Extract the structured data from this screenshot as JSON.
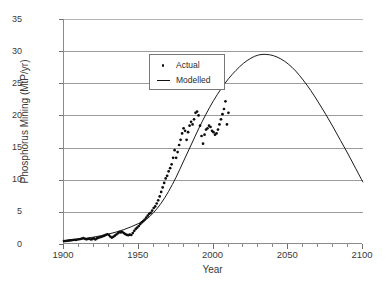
{
  "chart_data": {
    "type": "line",
    "title": "",
    "xlabel": "Year",
    "ylabel": "Phosphorus Mining (MtP/yr)",
    "xlim": [
      1900,
      2100
    ],
    "ylim": [
      0,
      35
    ],
    "xticks": [
      1900,
      1950,
      2000,
      2050,
      2100
    ],
    "xtick_labels": [
      "1900",
      "1950",
      "2000",
      "2050",
      "2100"
    ],
    "xtick_minor_step": 10,
    "yticks": [
      0,
      5,
      10,
      15,
      20,
      25,
      30,
      35
    ],
    "ytick_labels": [
      "0",
      "5",
      "10",
      "15",
      "20",
      "25",
      "30",
      "35"
    ],
    "grid": "horizontal",
    "legend_position": "upper-left-inside",
    "series": [
      {
        "name": "Actual",
        "label": "Actual",
        "marker": "dot",
        "color": "#0d0d0d",
        "points": [
          [
            1900,
            0.45
          ],
          [
            1901,
            0.47
          ],
          [
            1902,
            0.5
          ],
          [
            1903,
            0.53
          ],
          [
            1904,
            0.55
          ],
          [
            1905,
            0.58
          ],
          [
            1906,
            0.62
          ],
          [
            1907,
            0.66
          ],
          [
            1908,
            0.64
          ],
          [
            1909,
            0.7
          ],
          [
            1910,
            0.74
          ],
          [
            1911,
            0.78
          ],
          [
            1912,
            0.84
          ],
          [
            1913,
            0.9
          ],
          [
            1914,
            0.8
          ],
          [
            1915,
            0.72
          ],
          [
            1916,
            0.78
          ],
          [
            1917,
            0.82
          ],
          [
            1918,
            0.7
          ],
          [
            1919,
            0.76
          ],
          [
            1920,
            0.88
          ],
          [
            1921,
            0.7
          ],
          [
            1922,
            0.86
          ],
          [
            1923,
            0.98
          ],
          [
            1924,
            1.05
          ],
          [
            1925,
            1.12
          ],
          [
            1926,
            1.22
          ],
          [
            1927,
            1.3
          ],
          [
            1928,
            1.42
          ],
          [
            1929,
            1.52
          ],
          [
            1930,
            1.4
          ],
          [
            1931,
            1.15
          ],
          [
            1932,
            1.0
          ],
          [
            1933,
            1.12
          ],
          [
            1934,
            1.3
          ],
          [
            1935,
            1.48
          ],
          [
            1936,
            1.66
          ],
          [
            1937,
            1.86
          ],
          [
            1938,
            1.8
          ],
          [
            1939,
            1.88
          ],
          [
            1940,
            1.7
          ],
          [
            1941,
            1.55
          ],
          [
            1942,
            1.42
          ],
          [
            1943,
            1.38
          ],
          [
            1944,
            1.45
          ],
          [
            1945,
            1.4
          ],
          [
            1946,
            1.7
          ],
          [
            1947,
            2.05
          ],
          [
            1948,
            2.35
          ],
          [
            1949,
            2.55
          ],
          [
            1950,
            2.8
          ],
          [
            1951,
            3.1
          ],
          [
            1952,
            3.35
          ],
          [
            1953,
            3.55
          ],
          [
            1954,
            3.8
          ],
          [
            1955,
            4.1
          ],
          [
            1956,
            4.4
          ],
          [
            1957,
            4.7
          ],
          [
            1958,
            4.85
          ],
          [
            1959,
            5.2
          ],
          [
            1960,
            5.6
          ],
          [
            1961,
            5.85
          ],
          [
            1962,
            6.3
          ],
          [
            1963,
            6.8
          ],
          [
            1964,
            7.4
          ],
          [
            1965,
            8.1
          ],
          [
            1966,
            8.8
          ],
          [
            1967,
            9.5
          ],
          [
            1968,
            10.2
          ],
          [
            1969,
            10.6
          ],
          [
            1970,
            11.3
          ],
          [
            1971,
            11.8
          ],
          [
            1972,
            12.4
          ],
          [
            1973,
            13.4
          ],
          [
            1974,
            14.6
          ],
          [
            1975,
            13.4
          ],
          [
            1976,
            14.3
          ],
          [
            1977,
            15.4
          ],
          [
            1978,
            16.2
          ],
          [
            1979,
            17.2
          ],
          [
            1980,
            18.0
          ],
          [
            1981,
            17.6
          ],
          [
            1982,
            16.2
          ],
          [
            1983,
            17.4
          ],
          [
            1984,
            18.4
          ],
          [
            1985,
            19.0
          ],
          [
            1986,
            18.6
          ],
          [
            1987,
            19.4
          ],
          [
            1988,
            20.4
          ],
          [
            1989,
            20.6
          ],
          [
            1990,
            20.0
          ],
          [
            1991,
            18.4
          ],
          [
            1992,
            16.8
          ],
          [
            1993,
            15.6
          ],
          [
            1994,
            17.0
          ],
          [
            1995,
            17.8
          ],
          [
            1996,
            18.0
          ],
          [
            1997,
            18.4
          ],
          [
            1998,
            18.2
          ],
          [
            1999,
            17.6
          ],
          [
            2000,
            17.4
          ],
          [
            2001,
            17.0
          ],
          [
            2002,
            17.2
          ],
          [
            2003,
            17.8
          ],
          [
            2004,
            18.6
          ],
          [
            2005,
            19.4
          ],
          [
            2006,
            20.2
          ],
          [
            2007,
            21.0
          ],
          [
            2008,
            22.2
          ],
          [
            2009,
            18.6
          ],
          [
            2010,
            20.4
          ]
        ]
      },
      {
        "name": "Modelled",
        "label": "Modelled",
        "marker": "line",
        "color": "#1a1a1a",
        "points": [
          [
            1900,
            0.52
          ],
          [
            1905,
            0.62
          ],
          [
            1910,
            0.75
          ],
          [
            1915,
            0.9
          ],
          [
            1920,
            1.08
          ],
          [
            1925,
            1.3
          ],
          [
            1930,
            1.56
          ],
          [
            1935,
            1.87
          ],
          [
            1940,
            2.24
          ],
          [
            1945,
            2.68
          ],
          [
            1950,
            3.2
          ],
          [
            1955,
            3.82
          ],
          [
            1960,
            4.9
          ],
          [
            1965,
            6.35
          ],
          [
            1970,
            8.2
          ],
          [
            1975,
            10.4
          ],
          [
            1980,
            12.9
          ],
          [
            1985,
            15.4
          ],
          [
            1990,
            17.9
          ],
          [
            1995,
            20.2
          ],
          [
            2000,
            22.3
          ],
          [
            2005,
            24.1
          ],
          [
            2010,
            25.7
          ],
          [
            2015,
            27.0
          ],
          [
            2020,
            28.1
          ],
          [
            2025,
            28.9
          ],
          [
            2030,
            29.4
          ],
          [
            2035,
            29.5
          ],
          [
            2040,
            29.3
          ],
          [
            2045,
            28.8
          ],
          [
            2050,
            28.0
          ],
          [
            2055,
            26.9
          ],
          [
            2060,
            25.5
          ],
          [
            2065,
            23.9
          ],
          [
            2070,
            22.1
          ],
          [
            2075,
            20.2
          ],
          [
            2080,
            18.2
          ],
          [
            2085,
            16.1
          ],
          [
            2090,
            14.0
          ],
          [
            2095,
            11.8
          ],
          [
            2100,
            9.6
          ]
        ]
      }
    ]
  }
}
